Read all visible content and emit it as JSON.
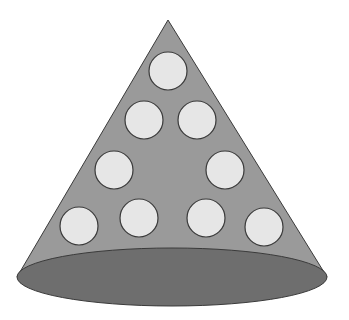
{
  "diagram": {
    "title": "",
    "shape": "cone",
    "colors": {
      "background": "#ffffff",
      "cone_body": "#9a9a9a",
      "cone_base": "#6e6e6e",
      "circle_fill": "#e6e6e6",
      "outline": "#3a3a3a"
    },
    "cone": {
      "apex": [
        168,
        20
      ],
      "base_center": [
        172,
        277
      ],
      "base_rx": 155,
      "base_ry": 29
    },
    "circles": [
      {
        "row": 1,
        "cx": 168,
        "cy": 71,
        "r": 19
      },
      {
        "row": 2,
        "cx": 144,
        "cy": 120,
        "r": 19
      },
      {
        "row": 2,
        "cx": 197,
        "cy": 120,
        "r": 19
      },
      {
        "row": 3,
        "cx": 114,
        "cy": 170,
        "r": 19
      },
      {
        "row": 3,
        "cx": 225,
        "cy": 170,
        "r": 19
      },
      {
        "row": 4,
        "cx": 79,
        "cy": 226,
        "r": 19
      },
      {
        "row": 4,
        "cx": 139,
        "cy": 218,
        "r": 19
      },
      {
        "row": 4,
        "cx": 206,
        "cy": 218,
        "r": 19
      },
      {
        "row": 4,
        "cx": 264,
        "cy": 227,
        "r": 19
      }
    ],
    "circle_count": 9,
    "row_pattern": [
      1,
      2,
      2,
      4
    ]
  }
}
